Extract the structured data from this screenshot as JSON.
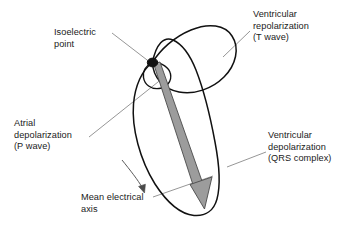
{
  "figure": {
    "name": "vectorcardiogram-loop-diagram",
    "background_color": "#ffffff",
    "line_color": "#111111",
    "leader_color": "#8a8a8a",
    "arrow_fill": "#9c9c9c",
    "text_color": "#1a1a1a"
  },
  "labels": {
    "isoelectric": {
      "line1": "Isoelectric",
      "line2": "point"
    },
    "t_wave": {
      "line1": "Ventricular",
      "line2": "repolarization",
      "line3": "(T wave)"
    },
    "p_wave": {
      "line1": "Atrial",
      "line2": "depolarization",
      "line3": "(P wave)"
    },
    "qrs": {
      "line1": "Ventricular",
      "line2": "depolarization",
      "line3": "(QRS complex)"
    },
    "mean_axis": {
      "line1": "Mean electrical",
      "line2": "axis"
    }
  },
  "elements": {
    "qrs_loop": "Large elongated vector loop from isoelectric point to lower right",
    "t_loop": "Tilted ellipse loop at top right",
    "p_loop": "Small ellipse loop just below isoelectric point",
    "isoelectric_dot": "Filled black dot at loop origin",
    "mean_axis_arrow": "Thick gray arrow along the long axis of the QRS loop",
    "rotation_arrow": "Thin curved arrow indicating loop inscription direction"
  }
}
